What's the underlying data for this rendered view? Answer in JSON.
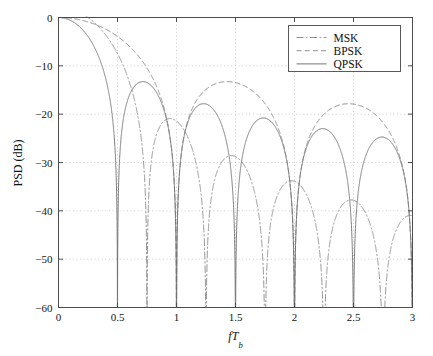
{
  "chart_data": {
    "type": "line",
    "title": "",
    "xlabel": "fT_b",
    "xlabel_parts": {
      "f": "f",
      "T": "T",
      "sub": "b"
    },
    "ylabel": "PSD (dB)",
    "xlim": [
      0,
      3
    ],
    "ylim": [
      -60,
      0
    ],
    "xticks": [
      0,
      0.5,
      1,
      1.5,
      2,
      2.5,
      3
    ],
    "xticklabels": [
      "0",
      "0.5",
      "1",
      "1.5",
      "2",
      "2.5",
      "3"
    ],
    "yticks": [
      0,
      -10,
      -20,
      -30,
      -40,
      -50,
      -60
    ],
    "yticklabels": [
      "0",
      "−10",
      "−20",
      "−30",
      "−40",
      "−50",
      "−60"
    ],
    "grid": true,
    "grid_style": "dotted",
    "legend_position": "top-right",
    "series": [
      {
        "name": "MSK",
        "style": "dash-dot",
        "color": "#8a8a8a",
        "formula": "msk",
        "nulls": [
          0.75,
          1.25,
          1.75,
          2.25,
          2.75
        ],
        "main_lobe_null": 0.75,
        "sidelobe_peaks_db": [
          -23.0,
          -31.0,
          -36.2,
          -40.2,
          -43.4
        ],
        "sidelobe_peak_positions": [
          0.97,
          1.49,
          2.0,
          2.5,
          3.0
        ]
      },
      {
        "name": "BPSK",
        "style": "dashed",
        "color": "#8a8a8a",
        "formula": "sinc2_f",
        "nulls": [
          1.0,
          2.0,
          3.0
        ],
        "main_lobe_null": 1.0,
        "sidelobe_peaks_db": [
          -13.3,
          -17.9
        ],
        "sidelobe_peak_positions": [
          1.43,
          2.46
        ]
      },
      {
        "name": "QPSK",
        "style": "solid",
        "color": "#6f6f6f",
        "formula": "sinc2_2f",
        "nulls": [
          0.5,
          1.0,
          1.5,
          2.0,
          2.5,
          3.0
        ],
        "main_lobe_null": 0.5,
        "sidelobe_peaks_db": [
          -13.3,
          -17.9,
          -20.8,
          -23.0,
          -24.7
        ],
        "sidelobe_peak_positions": [
          0.72,
          1.23,
          1.73,
          2.23,
          2.73
        ]
      }
    ]
  },
  "legend": {
    "entries": [
      {
        "label": "MSK",
        "style": "dash-dot"
      },
      {
        "label": "BPSK",
        "style": "dashed"
      },
      {
        "label": "QPSK",
        "style": "solid"
      }
    ]
  },
  "colors": {
    "axis": "#4d4d4d",
    "grid": "#b9b9b9",
    "text": "#141414",
    "background": "#ffffff",
    "qpsk": "#6f6f6f",
    "bpsk": "#8a8a8a",
    "msk": "#8a8a8a"
  }
}
